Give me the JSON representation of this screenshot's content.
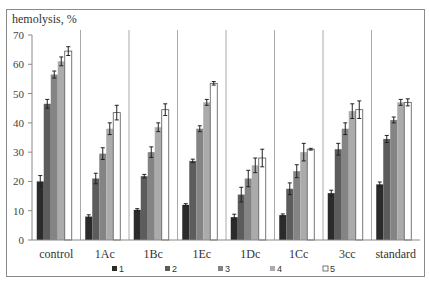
{
  "chart_data": {
    "type": "bar",
    "title": "",
    "ylabel": "hemolysis, %",
    "xlabel": "",
    "ylim": [
      0,
      70
    ],
    "yticks": [
      0,
      10,
      20,
      30,
      40,
      50,
      60,
      70
    ],
    "grid": false,
    "legend_position": "bottom",
    "categories": [
      "control",
      "1Ac",
      "1Bc",
      "1Ec",
      "1Dc",
      "1Cc",
      "3cc",
      "standard"
    ],
    "series": [
      {
        "name": "1",
        "color": "#2b2b2b",
        "values": [
          20,
          8,
          10.3,
          12,
          7.8,
          8.5,
          16,
          19
        ],
        "errors": [
          2,
          0.6,
          0.4,
          0.4,
          1,
          0.4,
          1,
          0.8
        ]
      },
      {
        "name": "2",
        "color": "#5c5c5c",
        "values": [
          46.5,
          21,
          21.8,
          27,
          15.5,
          17.5,
          31,
          34.5
        ],
        "errors": [
          1.5,
          1.8,
          0.6,
          0.6,
          2.5,
          2,
          2,
          1.2
        ]
      },
      {
        "name": "3",
        "color": "#848484",
        "values": [
          56.5,
          29.5,
          30,
          38,
          21,
          23.5,
          38,
          41
        ],
        "errors": [
          1.2,
          2,
          1.8,
          1,
          2.8,
          2.2,
          2,
          1
        ]
      },
      {
        "name": "4",
        "color": "#ababab",
        "values": [
          61,
          38,
          38.5,
          47,
          25.5,
          30,
          44,
          47
        ],
        "errors": [
          1.5,
          2,
          1.5,
          1,
          2.5,
          3,
          2.5,
          1
        ]
      },
      {
        "name": "5",
        "color": "#ffffff",
        "values": [
          64.5,
          43.5,
          44.5,
          53.5,
          28,
          31,
          44.5,
          47
        ],
        "errors": [
          1.5,
          2.5,
          2,
          0.6,
          3,
          0.3,
          3,
          1.2
        ]
      }
    ]
  }
}
